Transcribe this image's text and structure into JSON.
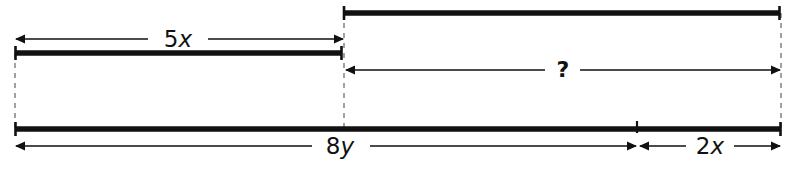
{
  "diagram": {
    "type": "bar-model",
    "background_color": "#ffffff",
    "stroke_color": "#111111",
    "dash_color": "#8a8a8a",
    "canvas": {
      "width": 797,
      "height": 169
    },
    "anchors": {
      "left_x": 15,
      "divider_x": 344,
      "tick_x": 637,
      "right_x": 781
    },
    "bars": [
      {
        "name": "top-right-bar",
        "x1": 343,
        "x2": 780,
        "y": 13,
        "thickness": 5,
        "end_caps": "both"
      },
      {
        "name": "upper-left-bar",
        "x1": 15,
        "x2": 342,
        "y": 53,
        "thickness": 5,
        "end_caps": "both"
      },
      {
        "name": "bottom-bar",
        "x1": 15,
        "x2": 781,
        "y": 129,
        "thickness": 5,
        "end_caps": "both",
        "tick_x": 637
      }
    ],
    "dashed_guides": [
      {
        "name": "left-guide",
        "x": 15,
        "y1": 53,
        "y2": 131
      },
      {
        "name": "middle-guide",
        "x": 344,
        "y1": 13,
        "y2": 131
      },
      {
        "name": "right-guide",
        "x": 781,
        "y1": 13,
        "y2": 131
      }
    ],
    "measures": [
      {
        "name": "measure-5x",
        "label": "5x",
        "label_number": "5",
        "label_variable": "x",
        "label_x": 178,
        "y": 39,
        "x1": 15,
        "x2": 344,
        "arrowheads": "both"
      },
      {
        "name": "measure-unknown",
        "label": "?",
        "label_number": "?",
        "label_variable": "",
        "label_x": 563,
        "y": 70,
        "x1": 345,
        "x2": 781,
        "arrowheads": "both"
      },
      {
        "name": "measure-8y",
        "label": "8y",
        "label_number": "8",
        "label_variable": "y",
        "label_x": 340,
        "y": 146,
        "x1": 15,
        "x2": 637,
        "arrowheads": "both"
      },
      {
        "name": "measure-2x",
        "label": "2x",
        "label_number": "2",
        "label_variable": "x",
        "label_x": 710,
        "y": 146,
        "x1": 638,
        "x2": 781,
        "arrowheads": "both"
      }
    ]
  }
}
